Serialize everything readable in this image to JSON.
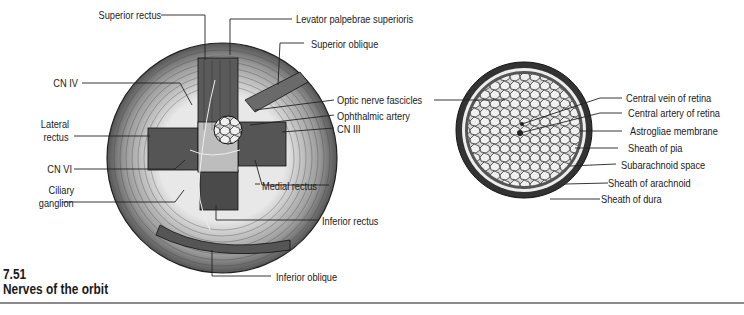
{
  "figure": {
    "number": "7.51",
    "title": "Nerves of the orbit"
  },
  "left_diagram": {
    "labels": {
      "superior_rectus": "Superior rectus",
      "levator_palpebrae_superioris": "Levator palpebrae superioris",
      "superior_oblique": "Superior oblique",
      "cn_iv": "CN IV",
      "optic_nerve_fascicles": "Optic nerve fascicles",
      "ophthalmic_artery": "Ophthalmic artery",
      "lateral_rectus_1": "Lateral",
      "lateral_rectus_2": "rectus",
      "cn_iii": "CN III",
      "cn_vi": "CN VI",
      "medial_rectus": "Medial rectus",
      "ciliary_ganglion_1": "Ciliary",
      "ciliary_ganglion_2": "ganglion",
      "inferior_rectus": "Inferior rectus",
      "inferior_oblique": "Inferior oblique"
    }
  },
  "right_diagram": {
    "labels": {
      "central_vein_of_retina": "Central vein of retina",
      "central_artery_of_retina": "Central artery of retina",
      "astrogliae_membrane": "Astrogliae membrane",
      "sheath_of_pia": "Sheath of pia",
      "subarachnoid_space": "Subarachnoid space",
      "sheath_of_arachnoid": "Sheath of arachnoid",
      "sheath_of_dura": "Sheath of dura"
    }
  }
}
